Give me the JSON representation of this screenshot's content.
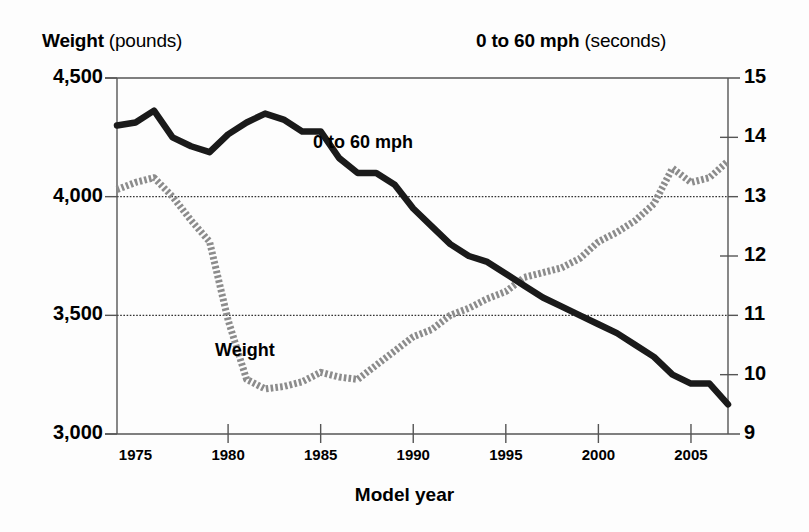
{
  "header": {
    "left_strong": "Weight",
    "left_rest": " (pounds)",
    "right_strong": "0 to 60 mph",
    "right_rest": " (seconds)"
  },
  "axes": {
    "x_title": "Model year",
    "y_left_ticks": [
      "4,500",
      "4,000",
      "3,500",
      "3,000"
    ],
    "y_right_ticks": [
      "15",
      "14",
      "13",
      "12",
      "11",
      "10",
      "9"
    ],
    "x_ticks": [
      "1975",
      "1980",
      "1985",
      "1990",
      "1995",
      "2000",
      "2005"
    ]
  },
  "series_labels": {
    "accel": "0 to 60 mph",
    "weight": "Weight"
  },
  "colors": {
    "accel_line": "#1a1a1a",
    "weight_line": "#8c8c8c",
    "axis": "#555555",
    "grid": "#333333",
    "background": "#fdfdfd"
  },
  "chart_data": {
    "type": "line",
    "title": "",
    "subtitle": "",
    "xlabel": "Model year",
    "ylabel": "Weight (pounds)",
    "y2label": "0 to 60 mph (seconds)",
    "xlim": [
      1974,
      2007
    ],
    "ylim": [
      3000,
      4500
    ],
    "y2lim": [
      9,
      15
    ],
    "grid": true,
    "grid_lines_left": [
      4000,
      3500
    ],
    "legend_position": "inline-labels",
    "x": [
      1974,
      1975,
      1976,
      1977,
      1978,
      1979,
      1980,
      1981,
      1982,
      1983,
      1984,
      1985,
      1986,
      1987,
      1988,
      1989,
      1990,
      1991,
      1992,
      1993,
      1994,
      1995,
      1996,
      1997,
      1998,
      1999,
      2000,
      2001,
      2002,
      2003,
      2004,
      2005,
      2006,
      2007
    ],
    "series": [
      {
        "name": "Weight",
        "axis": "left",
        "units": "pounds",
        "style": "dotted-thick",
        "color": "#8c8c8c",
        "values": [
          4030,
          4060,
          4080,
          4000,
          3900,
          3810,
          3480,
          3230,
          3190,
          3200,
          3220,
          3260,
          3240,
          3230,
          3290,
          3350,
          3410,
          3440,
          3500,
          3530,
          3570,
          3600,
          3660,
          3680,
          3700,
          3740,
          3810,
          3850,
          3900,
          3970,
          4120,
          4060,
          4080,
          4150
        ]
      },
      {
        "name": "0 to 60 mph",
        "axis": "right",
        "units": "seconds",
        "style": "solid-thick",
        "color": "#1a1a1a",
        "values": [
          14.2,
          14.25,
          14.45,
          14.0,
          13.85,
          13.75,
          14.05,
          14.25,
          14.4,
          14.3,
          14.1,
          14.1,
          13.65,
          13.4,
          13.4,
          13.2,
          12.8,
          12.5,
          12.2,
          12.0,
          11.9,
          11.7,
          11.5,
          11.3,
          11.15,
          11.0,
          10.85,
          10.7,
          10.5,
          10.3,
          10.0,
          9.85,
          9.85,
          9.5
        ]
      }
    ]
  },
  "geometry": {
    "plot_left": 117,
    "plot_right": 728,
    "plot_top": 78,
    "plot_bottom": 434
  }
}
